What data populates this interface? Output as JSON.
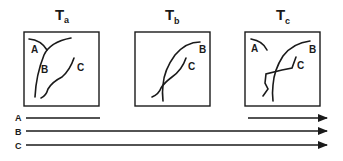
{
  "panels": [
    {
      "id": "a",
      "title": "T",
      "subscript": "a",
      "labels": {
        "A": "A",
        "B": "B",
        "C": "C"
      }
    },
    {
      "id": "b",
      "title": "T",
      "subscript": "b",
      "labels": {
        "B": "B",
        "C": "C"
      }
    },
    {
      "id": "c",
      "title": "T",
      "subscript": "c",
      "labels": {
        "A": "A",
        "B": "B",
        "C": "C"
      }
    }
  ],
  "timeline": {
    "rows": [
      {
        "label": "A",
        "segments": [
          "start-to-Ta",
          "Tc-to-end (arrow)"
        ]
      },
      {
        "label": "B",
        "segments": [
          "start-to-end (arrow)"
        ]
      },
      {
        "label": "C",
        "segments": [
          "start-to-end (arrow)"
        ]
      }
    ]
  },
  "colors": {
    "ink": "#1a1a1a",
    "background": "#ffffff"
  }
}
